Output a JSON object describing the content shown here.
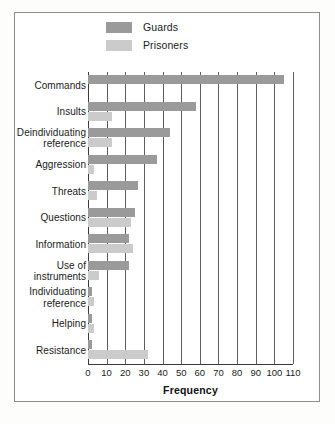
{
  "figure": {
    "legend": {
      "position": "top-center",
      "entries": [
        {
          "label": "Guards",
          "color": "#9a9a9a",
          "swatch_name": "legend-swatch-guards"
        },
        {
          "label": "Prisoners",
          "color": "#cbcbcb",
          "swatch_name": "legend-swatch-prisoners"
        }
      ]
    },
    "caption_fragment": ""
  },
  "chart_data": {
    "type": "bar",
    "orientation": "horizontal",
    "title": "",
    "xlabel": "Frequency",
    "ylabel": "",
    "xlim": [
      0,
      110
    ],
    "xticks": [
      0,
      10,
      20,
      30,
      40,
      50,
      60,
      70,
      80,
      90,
      100,
      110
    ],
    "xtick_labels": [
      "0",
      "10",
      "20",
      "30",
      "40",
      "50",
      "60",
      "70",
      "80",
      "90",
      "100",
      "110"
    ],
    "grid": "vertical",
    "legend_position": "top-center",
    "categories": [
      "Commands",
      "Insults",
      "Deindividuating reference",
      "Aggression",
      "Threats",
      "Questions",
      "Information",
      "Use of instruments",
      "Individuating reference",
      "Helping",
      "Resistance"
    ],
    "category_label_lines": [
      [
        "Commands"
      ],
      [
        "Insults"
      ],
      [
        "Deindividuating",
        "reference"
      ],
      [
        "Aggression"
      ],
      [
        "Threats"
      ],
      [
        "Questions"
      ],
      [
        "Information"
      ],
      [
        "Use of",
        "instruments"
      ],
      [
        "Individuating",
        "reference"
      ],
      [
        "Helping"
      ],
      [
        "Resistance"
      ]
    ],
    "series": [
      {
        "name": "Guards",
        "color": "#9a9a9a",
        "values": [
          105,
          58,
          44,
          37,
          27,
          25,
          22,
          22,
          2,
          2,
          2
        ]
      },
      {
        "name": "Prisoners",
        "color": "#cbcbcb",
        "values": [
          0,
          13,
          13,
          3,
          5,
          23,
          24,
          6,
          3,
          3,
          32
        ]
      }
    ]
  }
}
